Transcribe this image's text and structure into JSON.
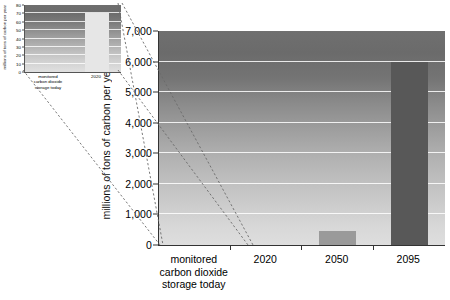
{
  "chart_data": [
    {
      "id": "main",
      "type": "bar",
      "title": "",
      "xlabel": "",
      "ylabel": "millions of tons of carbon per year",
      "categories": [
        "monitored\ncarbon dioxide\nstorage today",
        "2020",
        "2050",
        "2095"
      ],
      "category_lines": [
        [
          "monitored",
          "carbon dioxide",
          "storage today"
        ],
        [
          "2020"
        ],
        [
          "2050"
        ],
        [
          "2095"
        ]
      ],
      "values": [
        0,
        0,
        450,
        6000
      ],
      "ylim": [
        0,
        7000
      ],
      "ytick_values": [
        0,
        1000,
        2000,
        3000,
        4000,
        5000,
        6000,
        7000
      ],
      "ytick_labels": [
        "0",
        "1,000",
        "2,000",
        "3,000",
        "4,000",
        "5,000",
        "6,000",
        "7,000"
      ],
      "grid": true,
      "legend": "none",
      "bar_colors": [
        "#b9b9b9",
        "#c8c8c8",
        "#9a9a9a",
        "#585858"
      ],
      "plot_bg_top": "#6f6f6f",
      "plot_bg_bottom": "#dedede"
    },
    {
      "id": "inset",
      "type": "bar",
      "title": "",
      "xlabel": "",
      "ylabel": "millions of tons of carbon per year",
      "categories": [
        "monitored\ncarbon dioxide\nstorage today",
        "2020"
      ],
      "category_lines": [
        [
          "monitored",
          "carbon dioxide",
          "storage today"
        ],
        [
          "2020"
        ]
      ],
      "values": [
        0,
        70
      ],
      "ylim": [
        0,
        80
      ],
      "ytick_values": [
        0,
        10,
        20,
        30,
        40,
        50,
        60,
        70,
        80
      ],
      "ytick_labels": [
        "0",
        "10",
        "20",
        "30",
        "40",
        "50",
        "60",
        "70",
        "80"
      ],
      "grid": true,
      "legend": "none",
      "bar_colors": [
        "#c4c4c4",
        "#e6e6e6"
      ],
      "plot_bg_top": "#6e6e6e",
      "plot_bg_bottom": "#e0e0e0"
    }
  ],
  "main": {
    "ylabel": "millions of tons of carbon per year",
    "yticks": [
      {
        "label": "7,000",
        "value": 7000
      },
      {
        "label": "6,000",
        "value": 6000
      },
      {
        "label": "5,000",
        "value": 5000
      },
      {
        "label": "4,000",
        "value": 4000
      },
      {
        "label": "3,000",
        "value": 3000
      },
      {
        "label": "2,000",
        "value": 2000
      },
      {
        "label": "1,000",
        "value": 1000
      },
      {
        "label": "0",
        "value": 0
      }
    ],
    "xlabels": [
      {
        "line1": "monitored",
        "line2": "carbon dioxide",
        "line3": "storage today"
      },
      {
        "line1": "2020",
        "line2": "",
        "line3": ""
      },
      {
        "line1": "2050",
        "line2": "",
        "line3": ""
      },
      {
        "line1": "2095",
        "line2": "",
        "line3": ""
      }
    ]
  },
  "inset": {
    "ylabel": "millions of tons of carbon per year",
    "yticks": [
      {
        "label": "80",
        "value": 80
      },
      {
        "label": "70",
        "value": 70
      },
      {
        "label": "60",
        "value": 60
      },
      {
        "label": "50",
        "value": 50
      },
      {
        "label": "40",
        "value": 40
      },
      {
        "label": "30",
        "value": 30
      },
      {
        "label": "20",
        "value": 20
      },
      {
        "label": "10",
        "value": 10
      },
      {
        "label": "0",
        "value": 0
      }
    ],
    "xlabels": [
      {
        "line1": "monitored",
        "line2": "carbon dioxide",
        "line3": "storage today"
      },
      {
        "line1": "2020",
        "line2": "",
        "line3": ""
      }
    ]
  },
  "colors": {
    "axis": "#333333",
    "gridline": "#ffffff",
    "connector": "#6a6a6a",
    "text": "#000000"
  }
}
